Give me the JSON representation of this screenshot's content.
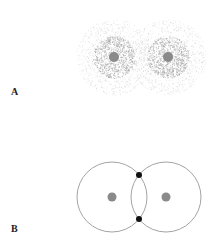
{
  "panels": [
    {
      "label": "A",
      "type": "electron-cloud",
      "nuclei": [
        {
          "cx": 114,
          "cy": 57,
          "r": 5
        },
        {
          "cx": 168,
          "cy": 57,
          "r": 5
        }
      ],
      "cloud_radius_dense": 20,
      "cloud_radius_faint": 38
    },
    {
      "label": "B",
      "type": "orbit-circles",
      "circles": [
        {
          "cx": 112,
          "cy": 197,
          "r": 35
        },
        {
          "cx": 166,
          "cy": 197,
          "r": 35
        }
      ],
      "shared_electrons": [
        {
          "cx": 139,
          "cy": 175,
          "r": 3
        },
        {
          "cx": 139,
          "cy": 219,
          "r": 3
        }
      ]
    }
  ],
  "colors": {
    "nucleus": "#8a8a8a",
    "cloud": "#9a9a9a",
    "orbit": "#999999",
    "electron": "#111111"
  }
}
